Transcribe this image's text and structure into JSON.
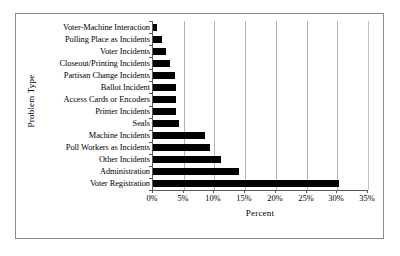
{
  "figure": {
    "background_color": "#ffffff",
    "frame_color": "#8d8d8d",
    "axis_color": "#585858",
    "gridline_color": "#b4b4b4",
    "bar_color": "#000000"
  },
  "chart_data": {
    "type": "bar",
    "orientation": "horizontal",
    "title": "",
    "xlabel": "Percent",
    "ylabel": "Problem Type",
    "xlim": [
      0,
      35
    ],
    "ylim": null,
    "grid": true,
    "legend": null,
    "xticks": [
      0,
      5,
      10,
      15,
      20,
      25,
      30,
      35
    ],
    "xtick_labels": [
      "0%",
      "5%",
      "10%",
      "15%",
      "20%",
      "25%",
      "30%",
      "35%"
    ],
    "categories": [
      "Voter-Machine Interaction",
      "Polling Place as Incidents",
      "Voter Incidents",
      "Closeout/Printing Incidents",
      "Partisan Change Incidents",
      "Ballot Incident",
      "Access Cards or Encoders",
      "Printer Incidents",
      "Seals",
      "Machine Incidents",
      "Poll Workers as Incidents",
      "Other Incidents",
      "Administration",
      "Voter Registration"
    ],
    "values": [
      0.7,
      1.5,
      2.1,
      2.8,
      3.5,
      3.7,
      3.7,
      3.7,
      4.2,
      8.5,
      9.2,
      11.0,
      14.0,
      30.2
    ],
    "value_unit": "percent"
  }
}
